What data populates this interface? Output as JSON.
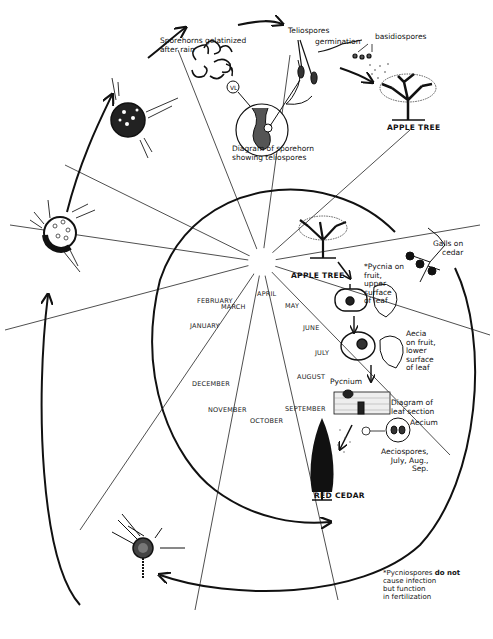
{
  "months": [
    {
      "name": "JANUARY",
      "x": 190,
      "y": 276
    },
    {
      "name": "FEBRUARY",
      "x": 197,
      "y": 245
    },
    {
      "name": "MARCH",
      "x": 221,
      "y": 302
    },
    {
      "name": "APRIL",
      "x": 257,
      "y": 290
    },
    {
      "name": "MAY",
      "x": 284,
      "y": 303
    },
    {
      "name": "JUNE",
      "x": 303,
      "y": 326
    },
    {
      "name": "JULY",
      "x": 313,
      "y": 353
    },
    {
      "name": "AUGUST",
      "x": 296,
      "y": 375
    },
    {
      "name": "SEPTEMBER",
      "x": 284,
      "y": 406
    },
    {
      "name": "OCTOBER",
      "x": 250,
      "y": 418
    },
    {
      "name": "NOVEMBER",
      "x": 208,
      "y": 407
    },
    {
      "name": "DECEMBER",
      "x": 190,
      "y": 374
    }
  ],
  "labels": {
    "sporehorns": "Sporehorns gelatinized\nafter rain",
    "teliospores": "Teliospores",
    "germination": "germination",
    "basidiospores": "basidiospores",
    "diagram_sporehorn": "Diagram of sporehorn\nshowing teliospores",
    "apple_tree_top": "APPLE TREE",
    "apple_tree_inner": "APPLE TREE",
    "galls_on_cedar": "Galls on\ncedar",
    "pycnia": "*Pycnia on\nfruit,\nupper\nsurface\nof leaf",
    "aecia": "Aecia\non fruit,\nlower\nsurface\nof leaf",
    "pycnium": "Pycnium",
    "diagram_leaf": "Diagram of\nleaf section",
    "aecium": "Aecium",
    "aeciospores": "Aeciospores,\nJuly, Aug.,\nSep.",
    "red_cedar": "RED CEDAR"
  },
  "footnote": {
    "bold_part": "do not",
    "line1_prefix": "*Pycniospores ",
    "line2": "cause infection",
    "line3": "but function",
    "line4": "in fertilization"
  }
}
